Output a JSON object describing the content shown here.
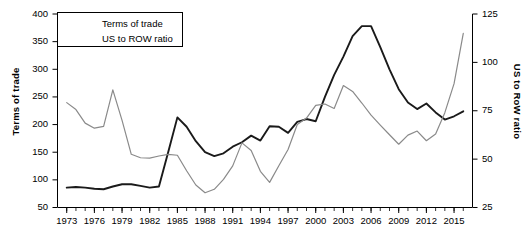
{
  "chart_data": {
    "type": "line",
    "title": "",
    "xlabel": "",
    "ylabel": "Terms of trade",
    "y2label": "US to RoW ratio",
    "grid": false,
    "legend_position": "top-left",
    "xlim": [
      1972,
      2017
    ],
    "ylim": [
      50,
      400
    ],
    "y2lim": [
      25,
      125
    ],
    "yticks": [
      50,
      100,
      150,
      200,
      250,
      300,
      350,
      400
    ],
    "y2ticks": [
      25,
      50,
      75,
      100,
      125
    ],
    "xticks": [
      1973,
      1976,
      1979,
      1982,
      1985,
      1988,
      1991,
      1994,
      1997,
      2000,
      2003,
      2006,
      2009,
      2012,
      2015
    ],
    "xtick_minor_step": 1,
    "x": [
      1973,
      1974,
      1975,
      1976,
      1977,
      1978,
      1979,
      1980,
      1981,
      1982,
      1983,
      1984,
      1985,
      1986,
      1987,
      1988,
      1989,
      1990,
      1991,
      1992,
      1993,
      1994,
      1995,
      1996,
      1997,
      1998,
      1999,
      2000,
      2001,
      2002,
      2003,
      2004,
      2005,
      2006,
      2007,
      2008,
      2009,
      2010,
      2011,
      2012,
      2013,
      2014,
      2015,
      2016
    ],
    "series": [
      {
        "name": "Terms of trade",
        "color": "#1a1a1a",
        "axis": "left",
        "width": 1.9,
        "values": [
          86,
          87,
          86,
          84,
          83,
          88,
          92,
          92,
          89,
          86,
          88,
          150,
          213,
          196,
          170,
          150,
          143,
          148,
          160,
          168,
          180,
          171,
          197,
          196,
          185,
          205,
          210,
          206,
          250,
          290,
          323,
          360,
          378,
          378,
          340,
          300,
          264,
          240,
          228,
          238,
          222,
          209,
          215,
          224
        ]
      },
      {
        "name": "US to ROW ratio",
        "color": "#8a8a8a",
        "axis": "right",
        "width": 1.2,
        "values": [
          79.2,
          75.6,
          68.6,
          66.0,
          66.9,
          85.8,
          70.0,
          52.5,
          50.7,
          50.5,
          51.6,
          52.5,
          52.0,
          44.0,
          36.6,
          32.6,
          34.4,
          39.5,
          46.5,
          58.4,
          54.5,
          43.7,
          38.0,
          46.6,
          55.0,
          67.9,
          71.2,
          77.8,
          78.5,
          76.2,
          88.0,
          85.0,
          79.0,
          72.7,
          67.6,
          62.6,
          57.7,
          62.4,
          64.5,
          59.5,
          63.0,
          74.0,
          89.0,
          115.0
        ]
      }
    ]
  },
  "legend": {
    "items": [
      {
        "label": "Terms of trade"
      },
      {
        "label": "US to ROW ratio"
      }
    ]
  },
  "axes": {
    "left": {
      "title": "Terms of trade",
      "tick_labels": [
        "400",
        "350",
        "300",
        "250",
        "200",
        "150",
        "100",
        "50"
      ]
    },
    "right": {
      "title": "US to RoW ratio",
      "tick_labels": [
        "125",
        "100",
        "75",
        "50",
        "25"
      ]
    },
    "bottom": {
      "tick_labels": [
        "1973",
        "1976",
        "1979",
        "1982",
        "1985",
        "1988",
        "1991",
        "1994",
        "1997",
        "2000",
        "2003",
        "2006",
        "2009",
        "2012",
        "2015"
      ]
    }
  },
  "colors": {
    "terms_of_trade": "#1a1a1a",
    "us_to_row": "#8a8a8a",
    "axis": "#000000",
    "background": "#ffffff"
  }
}
